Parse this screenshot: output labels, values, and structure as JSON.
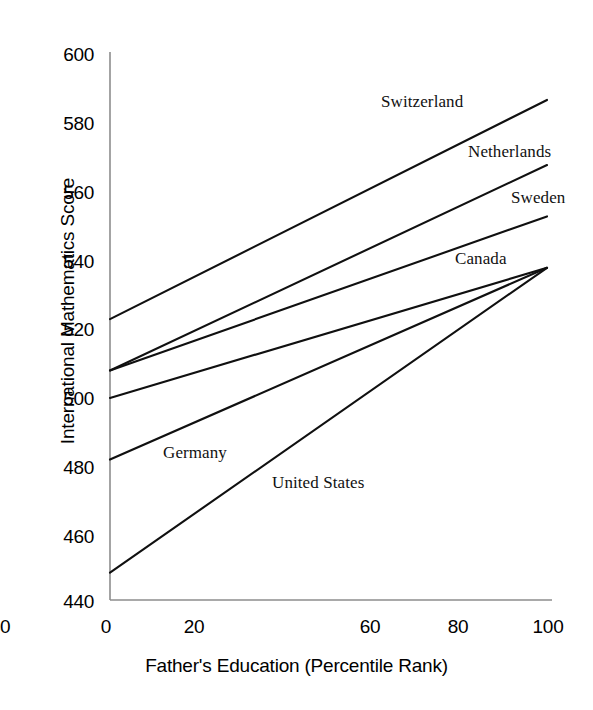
{
  "chart_data": {
    "type": "line",
    "title": "",
    "xlabel": "Father's Education (Percentile Rank)",
    "ylabel": "International Mathematics Score",
    "xlim": [
      0,
      100
    ],
    "ylim": [
      440,
      600
    ],
    "xticks": [
      "0",
      "20",
      "40",
      "60",
      "80",
      "100"
    ],
    "yticks": [
      "600",
      "580",
      "560",
      "540",
      "520",
      "500",
      "480",
      "460",
      "440"
    ],
    "grid": false,
    "legend_position": "inline-labels",
    "x": [
      0,
      100
    ],
    "series": [
      {
        "name": "Switzerland",
        "values": [
          522,
          586
        ]
      },
      {
        "name": "Netherlands",
        "values": [
          507,
          567
        ]
      },
      {
        "name": "Sweden",
        "values": [
          507,
          552
        ]
      },
      {
        "name": "Canada",
        "values": [
          499,
          537
        ]
      },
      {
        "name": "Germany",
        "values": [
          481,
          537
        ]
      },
      {
        "name": "United States",
        "values": [
          448,
          537
        ]
      }
    ],
    "line_color": "#101010",
    "axis_color": "#8a8a8a"
  },
  "axis": {
    "y_title": "International Mathematics Score",
    "x_title": "Father's Education (Percentile Rank)",
    "y_ticks": [
      {
        "label": "600"
      },
      {
        "label": "580"
      },
      {
        "label": "560"
      },
      {
        "label": "540"
      },
      {
        "label": "520"
      },
      {
        "label": "500"
      },
      {
        "label": "480"
      },
      {
        "label": "460"
      },
      {
        "label": "440"
      }
    ],
    "x_ticks": [
      {
        "label": "0"
      },
      {
        "label": "20"
      },
      {
        "label": "40"
      },
      {
        "label": "60"
      },
      {
        "label": "80"
      },
      {
        "label": "100"
      }
    ]
  },
  "labels": {
    "switzerland": "Switzerland",
    "netherlands": "Netherlands",
    "sweden": "Sweden",
    "canada": "Canada",
    "germany": "Germany",
    "united_states": "United States"
  }
}
